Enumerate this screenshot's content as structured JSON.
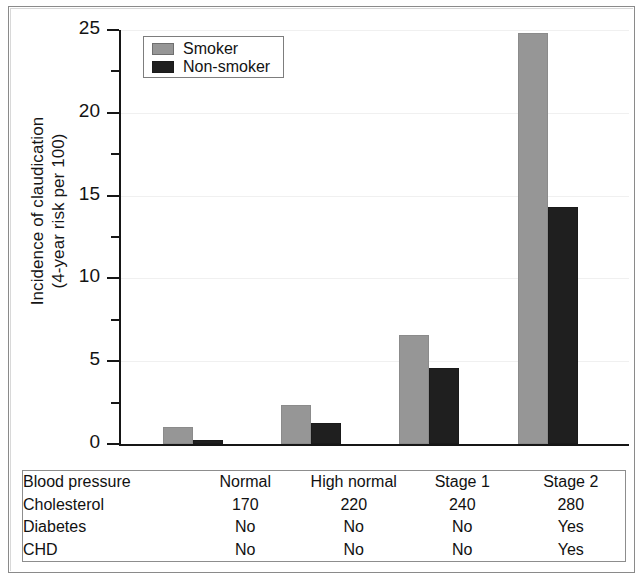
{
  "chart_data": {
    "type": "bar",
    "title": "",
    "xlabel": "",
    "ylabel": "Incidence of claudication (4-year risk per 100)",
    "ylabel_line1": "Incidence of claudication",
    "ylabel_line2": "(4-year risk per 100)",
    "ylim": [
      0,
      25
    ],
    "ytick_labels": [
      "0",
      "5",
      "10",
      "15",
      "20",
      "25"
    ],
    "ytick_values": [
      0,
      5,
      10,
      15,
      20,
      25
    ],
    "yminor_values": [
      2.5,
      7.5,
      12.5,
      17.5,
      22.5
    ],
    "grid": true,
    "grid_axis": "y",
    "legend_position": "top-left-inside",
    "categories": [
      "Normal",
      "High normal",
      "Stage 1",
      "Stage 2"
    ],
    "series": [
      {
        "name": "Smoker",
        "color": "#969696",
        "values": [
          1.05,
          2.35,
          6.6,
          24.8
        ]
      },
      {
        "name": "Non-smoker",
        "color": "#1f1f1f",
        "values": [
          0.25,
          1.25,
          4.6,
          14.3
        ]
      }
    ]
  },
  "legend": {
    "items": [
      {
        "label": "Smoker",
        "color": "#969696"
      },
      {
        "label": "Non-smoker",
        "color": "#1f1f1f"
      }
    ]
  },
  "table": {
    "rows": [
      {
        "label": "Blood pressure",
        "values": [
          "Normal",
          "High normal",
          "Stage 1",
          "Stage 2"
        ]
      },
      {
        "label": "Cholesterol",
        "values": [
          "170",
          "220",
          "240",
          "280"
        ]
      },
      {
        "label": "Diabetes",
        "values": [
          "No",
          "No",
          "No",
          "Yes"
        ]
      },
      {
        "label": "CHD",
        "values": [
          "No",
          "No",
          "No",
          "Yes"
        ]
      }
    ]
  }
}
